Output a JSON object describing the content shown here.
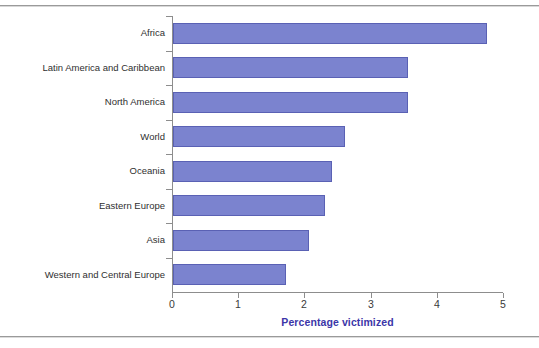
{
  "chart_data": {
    "type": "bar",
    "orientation": "horizontal",
    "title": "",
    "xlabel": "Percentage victimized",
    "ylabel": "",
    "xlim": [
      0,
      5
    ],
    "xticks": [
      "0",
      "1",
      "2",
      "3",
      "4",
      "5"
    ],
    "grid": false,
    "legend": null,
    "categories": [
      "Africa",
      "Latin America and Caribbean",
      "North America",
      "World",
      "Oceania",
      "Eastern Europe",
      "Asia",
      "Western and Central Europe"
    ],
    "values": [
      4.75,
      3.55,
      3.55,
      2.6,
      2.4,
      2.3,
      2.05,
      1.7
    ],
    "series": [
      {
        "name": "Percentage victimized",
        "values": [
          4.75,
          3.55,
          3.55,
          2.6,
          2.4,
          2.3,
          2.05,
          1.7
        ]
      }
    ],
    "colors": {
      "bar_fill": "#7b83cf",
      "bar_border": "#5a61b4",
      "axis_title": "#3b36a8",
      "axis_line": "#8d8d8d",
      "tick_label": "#3a3a3a",
      "category_label": "#2f2f2f",
      "background": "#ffffff",
      "frame_rule": "#9a9a9a"
    }
  }
}
